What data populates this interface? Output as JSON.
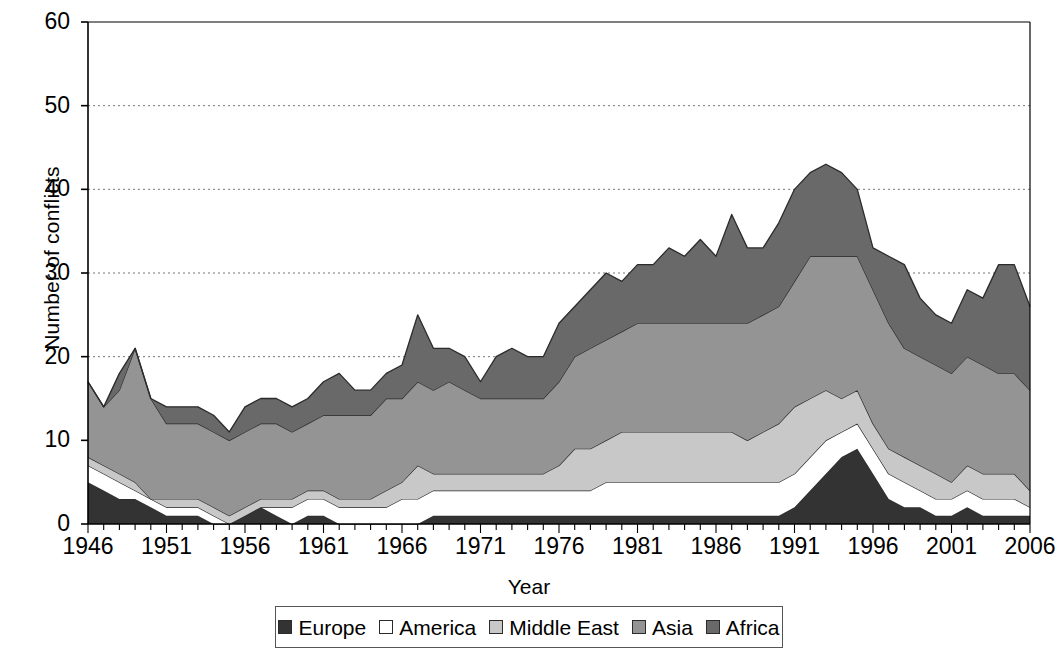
{
  "chart_data": {
    "type": "area",
    "stacked": true,
    "title": "",
    "xlabel": "Year",
    "ylabel": "Number of conflicts",
    "xlim": [
      1946,
      2006
    ],
    "ylim": [
      0,
      60
    ],
    "ytick_values": [
      0,
      10,
      20,
      30,
      40,
      50,
      60
    ],
    "ytick_labels": [
      "0",
      "10",
      "20",
      "30",
      "40",
      "50",
      "60"
    ],
    "xtick_values": [
      1946,
      1951,
      1956,
      1961,
      1966,
      1971,
      1976,
      1981,
      1986,
      1991,
      1996,
      2001,
      2006
    ],
    "xtick_labels": [
      "1946",
      "1951",
      "1956",
      "1961",
      "1966",
      "1971",
      "1976",
      "1981",
      "1986",
      "1991",
      "1996",
      "2001",
      "2006"
    ],
    "grid": "horizontal-dotted",
    "legend_position": "bottom",
    "minor_xticks_every": 1,
    "x": [
      1946,
      1947,
      1948,
      1949,
      1950,
      1951,
      1952,
      1953,
      1954,
      1955,
      1956,
      1957,
      1958,
      1959,
      1960,
      1961,
      1962,
      1963,
      1964,
      1965,
      1966,
      1967,
      1968,
      1969,
      1970,
      1971,
      1972,
      1973,
      1974,
      1975,
      1976,
      1977,
      1978,
      1979,
      1980,
      1981,
      1982,
      1983,
      1984,
      1985,
      1986,
      1987,
      1988,
      1989,
      1990,
      1991,
      1992,
      1993,
      1994,
      1995,
      1996,
      1997,
      1998,
      1999,
      2000,
      2001,
      2002,
      2003,
      2004,
      2005,
      2006
    ],
    "series": [
      {
        "name": "Europe",
        "color": "#333333",
        "values": [
          5,
          4,
          3,
          3,
          2,
          1,
          1,
          1,
          0,
          0,
          1,
          2,
          1,
          0,
          1,
          1,
          0,
          0,
          0,
          0,
          0,
          0,
          1,
          1,
          1,
          1,
          1,
          1,
          1,
          1,
          1,
          1,
          1,
          1,
          1,
          1,
          1,
          1,
          1,
          1,
          1,
          1,
          1,
          1,
          1,
          2,
          4,
          6,
          8,
          9,
          6,
          3,
          2,
          2,
          1,
          1,
          2,
          1,
          1,
          1,
          1
        ]
      },
      {
        "name": "America",
        "color": "#ffffff",
        "values": [
          2,
          2,
          2,
          1,
          1,
          1,
          1,
          1,
          1,
          0,
          0,
          0,
          1,
          2,
          2,
          2,
          2,
          2,
          2,
          2,
          3,
          3,
          3,
          3,
          3,
          3,
          3,
          3,
          3,
          3,
          3,
          3,
          3,
          4,
          4,
          4,
          4,
          4,
          4,
          4,
          4,
          4,
          4,
          4,
          4,
          4,
          4,
          4,
          3,
          3,
          3,
          3,
          3,
          2,
          2,
          2,
          2,
          2,
          2,
          2,
          1
        ]
      },
      {
        "name": "Middle East",
        "color": "#c8c8c8",
        "values": [
          1,
          1,
          1,
          1,
          0,
          1,
          1,
          1,
          1,
          1,
          1,
          1,
          1,
          1,
          1,
          1,
          1,
          1,
          1,
          2,
          2,
          4,
          2,
          2,
          2,
          2,
          2,
          2,
          2,
          2,
          3,
          5,
          5,
          5,
          6,
          6,
          6,
          6,
          6,
          6,
          6,
          6,
          5,
          6,
          7,
          8,
          7,
          6,
          4,
          4,
          3,
          3,
          3,
          3,
          3,
          2,
          3,
          3,
          3,
          3,
          2
        ]
      },
      {
        "name": "Asia",
        "color": "#949494",
        "values": [
          9,
          7,
          10,
          16,
          12,
          9,
          9,
          9,
          9,
          9,
          9,
          9,
          9,
          8,
          8,
          9,
          10,
          10,
          10,
          11,
          10,
          10,
          10,
          11,
          10,
          9,
          9,
          9,
          9,
          9,
          10,
          11,
          12,
          12,
          12,
          13,
          13,
          13,
          13,
          13,
          13,
          13,
          14,
          14,
          14,
          15,
          17,
          16,
          17,
          16,
          16,
          15,
          13,
          13,
          13,
          13,
          13,
          13,
          12,
          12,
          12
        ]
      },
      {
        "name": "Africa",
        "color": "#696969",
        "values": [
          0,
          0,
          2,
          0,
          0,
          2,
          2,
          2,
          2,
          1,
          3,
          3,
          3,
          3,
          3,
          4,
          5,
          3,
          3,
          3,
          4,
          8,
          5,
          4,
          4,
          2,
          5,
          6,
          5,
          5,
          7,
          6,
          7,
          8,
          6,
          7,
          7,
          9,
          8,
          10,
          8,
          13,
          9,
          8,
          10,
          11,
          10,
          11,
          10,
          8,
          5,
          8,
          10,
          7,
          6,
          6,
          8,
          8,
          13,
          13,
          10
        ]
      }
    ],
    "totals": [
      17,
      14,
      18,
      21,
      15,
      14,
      14,
      14,
      13,
      11,
      14,
      15,
      15,
      14,
      15,
      17,
      18,
      16,
      16,
      18,
      19,
      25,
      21,
      21,
      20,
      17,
      20,
      21,
      20,
      20,
      24,
      26,
      28,
      30,
      29,
      31,
      31,
      33,
      32,
      34,
      32,
      37,
      33,
      33,
      36,
      40,
      42,
      43,
      42,
      40,
      33,
      32,
      31,
      27,
      25,
      24,
      28,
      27,
      31,
      31,
      26
    ]
  },
  "legend": {
    "items": [
      {
        "label": "Europe",
        "color": "#333333"
      },
      {
        "label": "America",
        "color": "#ffffff"
      },
      {
        "label": "Middle East",
        "color": "#c8c8c8"
      },
      {
        "label": "Asia",
        "color": "#949494"
      },
      {
        "label": "Africa",
        "color": "#696969"
      }
    ]
  }
}
